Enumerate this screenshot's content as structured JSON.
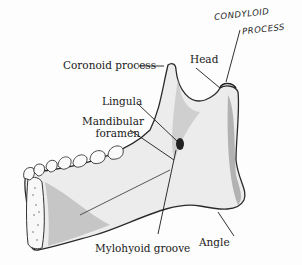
{
  "diagram": {
    "labels": {
      "coronoid_process": "Coronoid process",
      "head": "Head",
      "lingula": "Lingula",
      "mandibular_foramen_line1": "Mandibular",
      "mandibular_foramen_line2": "foramen",
      "mylohyoid_groove": "Mylohyoid groove",
      "angle": "Angle"
    },
    "handwritten": {
      "line1": "CONDYLOID",
      "line2": "PROCESS"
    },
    "colors": {
      "background": "#fdfdfd",
      "ink": "#1a1a1a",
      "bone_fill": "#e9e9e9",
      "shade": "#8a8a8a"
    }
  }
}
